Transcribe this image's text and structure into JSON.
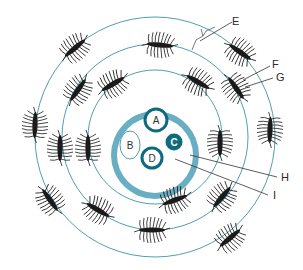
{
  "diagram": {
    "colors": {
      "ring_line": "#4f9fb0",
      "outer_wall": "#6aaec4",
      "dark_teal": "#0e6b7d",
      "organism": "#1a1a1a",
      "label_line": "#333333"
    },
    "inner_labels": {
      "A": "A",
      "B": "B",
      "C": "C",
      "D": "D"
    },
    "callouts": [
      {
        "id": "E",
        "label": "E"
      },
      {
        "id": "F",
        "label": "F"
      },
      {
        "id": "G",
        "label": "G"
      },
      {
        "id": "H",
        "label": "H"
      },
      {
        "id": "I",
        "label": "I"
      }
    ],
    "rings": [
      "inner ring",
      "middle ring",
      "outer ring"
    ],
    "organism_icon": "hairy-organism-icon"
  }
}
